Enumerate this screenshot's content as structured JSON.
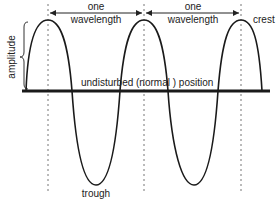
{
  "diagram": {
    "labels": {
      "amplitude": "amplitude",
      "wavelength_1_top": "one",
      "wavelength_1_bottom": "wavelength",
      "wavelength_2_top": "one",
      "wavelength_2_bottom": "wavelength",
      "crest": "crest",
      "trough": "trough",
      "baseline": "undisturbed (normal ) position"
    },
    "geometry": {
      "baseline_y": 91,
      "baseline_x_start": 22,
      "baseline_x_end": 270,
      "crest_y": 20,
      "trough_y": 185,
      "crests_x": [
        48,
        144,
        241
      ],
      "troughs_x": [
        96,
        194
      ],
      "wave_start_x": 26,
      "wave_end_x": 262,
      "arrow_y": 13,
      "dashed_bottom_y": 193
    },
    "colors": {
      "wave": "#1a1a1a",
      "baseline": "#1a1a1a",
      "dashed": "#777777",
      "text": "#222222"
    }
  }
}
